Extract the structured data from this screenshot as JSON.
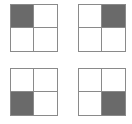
{
  "diagram": {
    "colors": {
      "fill": "#6a6a6a",
      "border": "#8a8a8a",
      "empty": "#ffffff"
    },
    "grids": [
      {
        "name": "grid-top-left",
        "left": 10,
        "top": 4,
        "filled_index": 0,
        "filled_position": "top-left"
      },
      {
        "name": "grid-top-right",
        "left": 78,
        "top": 4,
        "filled_index": 1,
        "filled_position": "top-right"
      },
      {
        "name": "grid-bottom-left",
        "left": 10,
        "top": 68,
        "filled_index": 2,
        "filled_position": "bottom-left"
      },
      {
        "name": "grid-bottom-right",
        "left": 78,
        "top": 68,
        "filled_index": 3,
        "filled_position": "bottom-right"
      }
    ]
  }
}
